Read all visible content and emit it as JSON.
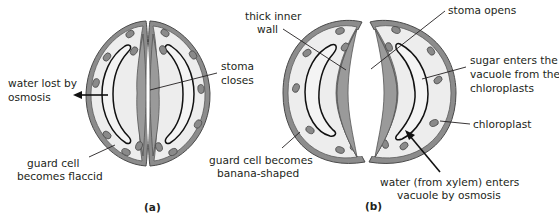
{
  "figure": {
    "colors": {
      "cell_wall": "#8c8c8c",
      "cytoplasm": "#ededed",
      "vacuole_outline": "#111111",
      "chloroplast": "#8a8a8a",
      "text": "#231f20"
    },
    "panels": [
      {
        "id": "a",
        "label": "(a)",
        "state": "stoma closed",
        "annotations": {
          "water_lost": [
            "water lost by",
            "osmosis"
          ],
          "stoma_closes": [
            "stoma",
            "closes"
          ],
          "flaccid": [
            "guard cell",
            "becomes flaccid"
          ]
        }
      },
      {
        "id": "b",
        "label": "(b)",
        "state": "stoma open",
        "annotations": {
          "thick_wall": [
            "thick inner",
            "wall"
          ],
          "stoma_opens": [
            "stoma opens"
          ],
          "sugar": [
            "sugar enters the",
            "vacuole from the",
            "chloroplasts"
          ],
          "chloroplast": [
            "chloroplast"
          ],
          "banana": [
            "guard cell becomes",
            "banana-shaped"
          ],
          "water_enters": [
            "water (from xylem) enters",
            "vacuole by osmosis"
          ]
        }
      }
    ]
  }
}
